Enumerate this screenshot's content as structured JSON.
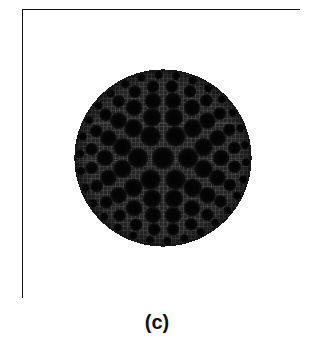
{
  "figure": {
    "caption": "(c)",
    "frame": {
      "x": 22,
      "y": 9,
      "width": 278,
      "height": 289,
      "border_color": "#111111",
      "border_width": 2,
      "background": "#ffffff"
    },
    "cross_section": {
      "name": "meshed-circular-fiber-cross-section",
      "center_x": 162,
      "center_y": 157,
      "radius": 88,
      "cladding_color": "#2b2b2b",
      "hole_color": "#050505",
      "mesh_line_color": "#4a4a4a",
      "mesh_spacing": 4,
      "outline_color": "#151515"
    },
    "chart_data": {
      "type": "scatter",
      "title": "(c)",
      "xlabel": "",
      "ylabel": "",
      "description": "Finite-element mesh of a circular microstructured optical fibre cross-section with concentric rings of air holes.",
      "geometry": {
        "boundary": "circle",
        "center": [
          162,
          157
        ],
        "radius": 88
      },
      "rings": [
        {
          "name": "core",
          "ring_radius": 0,
          "hole_count": 1,
          "hole_radius": 11.5,
          "angle_offset": 0
        },
        {
          "name": "ring-1",
          "ring_radius": 25,
          "hole_count": 6,
          "hole_radius": 10.5,
          "angle_offset": 0
        },
        {
          "name": "ring-2",
          "ring_radius": 42,
          "hole_count": 12,
          "hole_radius": 9.5,
          "angle_offset": 15
        },
        {
          "name": "ring-3",
          "ring_radius": 58,
          "hole_count": 18,
          "hole_radius": 8.5,
          "angle_offset": 0
        },
        {
          "name": "ring-4",
          "ring_radius": 72,
          "hole_count": 24,
          "hole_radius": 6.5,
          "angle_offset": 7
        },
        {
          "name": "ring-5",
          "ring_radius": 83,
          "hole_count": 30,
          "hole_radius": 4.2,
          "angle_offset": 3
        }
      ],
      "total_holes": 91,
      "legend": [],
      "grid": true
    }
  }
}
